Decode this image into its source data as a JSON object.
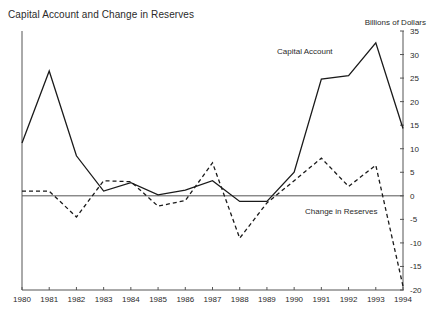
{
  "chart_data": {
    "type": "line",
    "title": "Capital Account and Change in Reserves",
    "xlabel": "",
    "ylabel": "Billions of Dollars",
    "unit_label": "Billions of Dollars",
    "x": [
      1980,
      1981,
      1982,
      1983,
      1984,
      1985,
      1986,
      1987,
      1988,
      1989,
      1990,
      1991,
      1992,
      1993,
      1994
    ],
    "categories": [
      "1980",
      "1981",
      "1982",
      "1983",
      "1984",
      "1985",
      "1986",
      "1987",
      "1988",
      "1989",
      "1990",
      "1991",
      "1992",
      "1993",
      "1994"
    ],
    "xlim": [
      1980,
      1994
    ],
    "ylim": [
      -20,
      35
    ],
    "yticks": [
      -20,
      -15,
      -10,
      -5,
      0,
      5,
      10,
      15,
      20,
      25,
      30,
      35
    ],
    "ytick_labels": [
      "-20",
      "-15",
      "-10",
      "-5",
      "0",
      "5",
      "10",
      "15",
      "20",
      "25",
      "30",
      "35"
    ],
    "grid": false,
    "legend_position": "inline-annotations",
    "zero_line": 0,
    "series": [
      {
        "name": "Capital Account",
        "style": "solid",
        "color": "#1a1a1a",
        "values": [
          11.2,
          26.5,
          8.5,
          1.0,
          2.8,
          0.2,
          1.2,
          3.2,
          -1.2,
          -1.2,
          5.0,
          24.8,
          25.5,
          32.5,
          14.3
        ]
      },
      {
        "name": "Change in Reserves",
        "style": "dashed",
        "color": "#1a1a1a",
        "values": [
          1.0,
          1.0,
          -4.5,
          3.2,
          3.0,
          -2.2,
          -1.0,
          7.0,
          -9.0,
          -1.5,
          3.2,
          8.0,
          2.0,
          6.5,
          -19.2
        ]
      }
    ]
  },
  "annotations": {
    "capital_account_label": "Capital Account",
    "change_reserves_label": "Change in Reserves"
  }
}
